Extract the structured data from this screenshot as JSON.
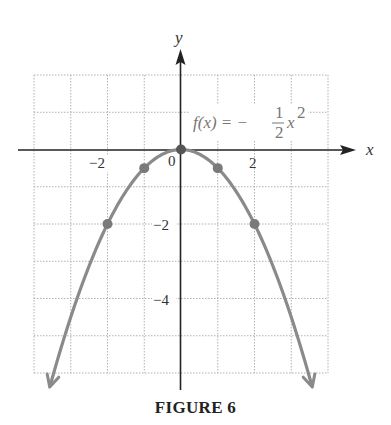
{
  "caption": "FIGURE 6",
  "colors": {
    "curve": "#8a8a8a",
    "axis": "#222222",
    "grid": "#b0b0b0",
    "point": "#7a7a7a"
  },
  "labels": {
    "x_axis": "x",
    "y_axis": "y",
    "function": {
      "lhs": "f(x) = −",
      "num": "1",
      "den": "2",
      "var": "x",
      "exp": "2"
    }
  },
  "ticks": {
    "x": [
      {
        "value": -2,
        "label": "−2"
      },
      {
        "value": 0,
        "label": "0"
      },
      {
        "value": 2,
        "label": "2"
      }
    ],
    "y": [
      {
        "value": -2,
        "label": "−2"
      },
      {
        "value": -4,
        "label": "−4"
      }
    ]
  },
  "chart_data": {
    "type": "line",
    "title": "FIGURE 6",
    "function": "f(x) = -1/2 x^2",
    "xlabel": "x",
    "ylabel": "y",
    "xlim": [
      -4,
      4
    ],
    "ylim": [
      -6,
      2
    ],
    "grid": true,
    "grid_step": 1,
    "x_ticks_labeled": [
      -2,
      0,
      2
    ],
    "y_ticks_labeled": [
      -2,
      -4
    ],
    "highlighted_points": [
      {
        "x": -2,
        "y": -2
      },
      {
        "x": -1,
        "y": -0.5
      },
      {
        "x": 0,
        "y": 0
      },
      {
        "x": 1,
        "y": -0.5
      },
      {
        "x": 2,
        "y": -2
      }
    ],
    "curve_domain": [
      -3.55,
      3.55
    ],
    "arrows_at_ends": true
  }
}
